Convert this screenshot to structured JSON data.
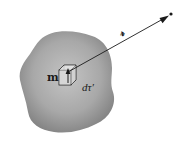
{
  "figure": {
    "labels": {
      "dipole_moment": "m",
      "volume_element": "dτ′",
      "separation_vector": "𝓇"
    },
    "colors": {
      "blob_center": "#bdbdbd",
      "blob_edge": "#7a7a7a",
      "line": "#1a1a1a",
      "background": "#ffffff"
    }
  }
}
